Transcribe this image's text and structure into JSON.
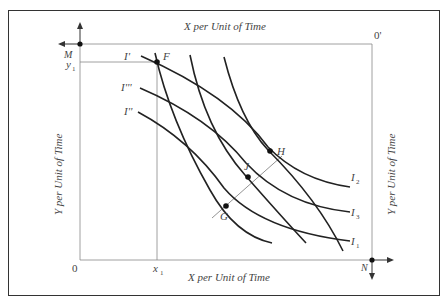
{
  "diagram": {
    "type": "edgeworth_box",
    "top_axis_label": "X per Unit of Time",
    "bottom_axis_label": "X per Unit of Time",
    "left_axis_label": "Y per Unit of Time",
    "right_axis_label": "Y per Unit of Time",
    "origin_bottom_left": "0",
    "origin_top_right": "0'",
    "corner_top_left": "M",
    "corner_bottom_right": "N",
    "x_mark": "x",
    "x_mark_sub": "1",
    "y_mark": "y",
    "y_mark_sub": "1",
    "points": [
      {
        "label": "F"
      },
      {
        "label": "G"
      },
      {
        "label": "J"
      },
      {
        "label": "H"
      }
    ],
    "left_curves": [
      {
        "label": "I'"
      },
      {
        "label": "I'''"
      },
      {
        "label": "I''"
      }
    ],
    "right_curves": [
      {
        "label": "I",
        "sub": "2"
      },
      {
        "label": "I",
        "sub": "3"
      },
      {
        "label": "I",
        "sub": "1"
      }
    ]
  }
}
